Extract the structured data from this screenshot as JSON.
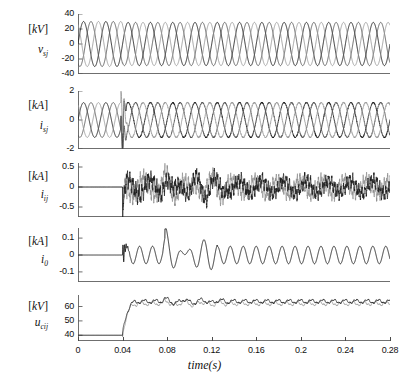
{
  "figure": {
    "width": 409,
    "height": 381,
    "background": "#ffffff",
    "xaxis_title": "time(s)",
    "xticks": [
      "0",
      "0.04",
      "0.08",
      "0.12",
      "0.16",
      "0.2",
      "0.24",
      "0.28"
    ],
    "xlim": [
      0,
      0.28
    ],
    "fault_time": 0.04,
    "colors": {
      "trace_dark": "#1b1b1b",
      "trace_mid": "#555555",
      "trace_light": "#9a9a9a",
      "axis": "#4a4a4a"
    }
  },
  "chart_data": [
    {
      "id": "panel-vsj",
      "type": "line",
      "title": "",
      "unit": "[kV]",
      "variable": "v",
      "variable_sub": "sj",
      "ylabel": "v_sj [kV]",
      "xlabel": "time(s)",
      "ylim": [
        -40,
        40
      ],
      "yticks": [
        40,
        20,
        0,
        -20,
        -40
      ],
      "ytick_labels": [
        "40",
        "20",
        "0",
        "-20",
        "-40"
      ],
      "xlim": [
        0,
        0.28
      ],
      "grid": false,
      "legend": "none",
      "description": "Three-phase source voltages, sinusoidal 50 Hz, amplitude about 30 kV, slight amplitude change after fault at 0.04 s",
      "series": [
        {
          "name": "phase-a",
          "color": "#1b1b1b",
          "amplitude": 30,
          "frequency": 50,
          "phase_deg": 0
        },
        {
          "name": "phase-b",
          "color": "#555555",
          "amplitude": 30,
          "frequency": 50,
          "phase_deg": -120
        },
        {
          "name": "phase-c",
          "color": "#9a9a9a",
          "amplitude": 30,
          "frequency": 50,
          "phase_deg": 120
        }
      ]
    },
    {
      "id": "panel-isj",
      "type": "line",
      "unit": "[kA]",
      "variable": "i",
      "variable_sub": "sj",
      "ylabel": "i_sj [kA]",
      "xlabel": "time(s)",
      "ylim": [
        -2,
        2
      ],
      "yticks": [
        2,
        0,
        -2
      ],
      "ytick_labels": [
        "2",
        "0",
        "-2"
      ],
      "xlim": [
        0,
        0.28
      ],
      "grid": false,
      "legend": "none",
      "description": "Three-phase source currents, amplitude about 1.2 kA, transient spike reaching -2 kA at fault time 0.04 s",
      "series": [
        {
          "name": "phase-a",
          "color": "#1b1b1b",
          "amplitude": 1.2,
          "frequency": 50,
          "phase_deg": 0
        },
        {
          "name": "phase-b",
          "color": "#555555",
          "amplitude": 1.2,
          "frequency": 50,
          "phase_deg": -120
        },
        {
          "name": "phase-c",
          "color": "#9a9a9a",
          "amplitude": 1.2,
          "frequency": 50,
          "phase_deg": 120
        }
      ]
    },
    {
      "id": "panel-iij",
      "type": "line",
      "unit": "[kA]",
      "variable": "i",
      "variable_sub": "ij",
      "ylabel": "i_ij [kA]",
      "xlabel": "time(s)",
      "ylim": [
        -0.75,
        0.6
      ],
      "yticks": [
        0.5,
        0,
        -0.5
      ],
      "ytick_labels": [
        "0.5",
        "0",
        "-0.5"
      ],
      "xlim": [
        0,
        0.28
      ],
      "grid": false,
      "legend": "none",
      "description": "Converter currents, zero before fault at 0.04 s, then high-frequency ripple band of about +/-0.25 kA with downward spike to -0.7 kA at onset and larger excursions near 0.10-0.13 s",
      "series": [
        {
          "name": "i-ij-a",
          "color": "#1b1b1b"
        },
        {
          "name": "i-ij-b",
          "color": "#9a9a9a"
        }
      ]
    },
    {
      "id": "panel-i0",
      "type": "line",
      "unit": "[kA]",
      "variable": "i",
      "variable_sub": "0",
      "ylabel": "i_0 [kA]",
      "xlabel": "time(s)",
      "ylim": [
        -0.16,
        0.16
      ],
      "yticks": [
        0.1,
        0,
        -0.1
      ],
      "ytick_labels": [
        "0.1",
        "0",
        "-0.1"
      ],
      "xlim": [
        0,
        0.28
      ],
      "grid": false,
      "legend": "none",
      "description": "Zero-sequence current, flat at 0 before 0.04 s, sharp spike to 0.13 kA then damped oscillation settling to steady ripple of about 0.05 kA",
      "series": [
        {
          "name": "i-0",
          "color": "#1b1b1b"
        }
      ]
    },
    {
      "id": "panel-ucij",
      "type": "line",
      "unit": "[kV]",
      "variable": "u",
      "variable_sub": "cij",
      "ylabel": "u_cij [kV]",
      "xlabel": "time(s)",
      "ylim": [
        36,
        68
      ],
      "yticks": [
        60,
        50,
        40
      ],
      "ytick_labels": [
        "60",
        "50",
        "40"
      ],
      "xlim": [
        0,
        0.28
      ],
      "grid": false,
      "legend": "none",
      "description": "Capacitor voltages, constant at 40 kV before 0.04 s, step rise to about 63 kV with ripple, settling near 63 kV with oscillation around 0.08-0.13 s",
      "series": [
        {
          "name": "u-cij-a",
          "color": "#1b1b1b"
        },
        {
          "name": "u-cij-b",
          "color": "#8f8f8f"
        }
      ]
    }
  ]
}
